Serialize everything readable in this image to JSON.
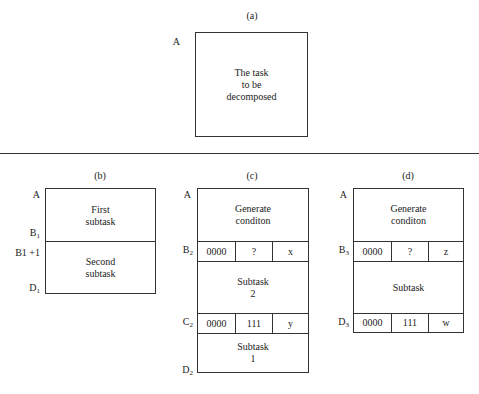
{
  "panels": {
    "a": {
      "caption": "(a)",
      "label_top": "A",
      "text_lines": [
        "The task",
        "to be",
        "decomposed"
      ]
    },
    "b": {
      "caption": "(b)",
      "labels": {
        "top": "A",
        "b1": "B",
        "b1_sub": "1",
        "b1plus": "B1 +1",
        "d1": "D",
        "d1_sub": "1"
      },
      "sections": [
        {
          "lines": [
            "First",
            "subtask"
          ]
        },
        {
          "lines": [
            "Second",
            "subtask"
          ]
        }
      ]
    },
    "c": {
      "caption": "(c)",
      "labels": {
        "top": "A",
        "b2": "B",
        "b2_sub": "2",
        "c2": "C",
        "c2_sub": "2",
        "d2": "D",
        "d2_sub": "2"
      },
      "header": {
        "lines": [
          "Generate",
          "conditon"
        ]
      },
      "row_b": [
        "0000",
        "?",
        "x"
      ],
      "middle": {
        "lines": [
          "Subtask",
          "2"
        ]
      },
      "row_c": [
        "0000",
        "111",
        "y"
      ],
      "bottom": {
        "lines": [
          "Subtask",
          "1"
        ]
      }
    },
    "d": {
      "caption": "(d)",
      "labels": {
        "top": "A",
        "b3": "B",
        "b3_sub": "3",
        "d3": "D",
        "d3_sub": "3"
      },
      "header": {
        "lines": [
          "Generate",
          "conditon"
        ]
      },
      "row_b": [
        "0000",
        "?",
        "z"
      ],
      "middle": {
        "lines": [
          "Subtask"
        ]
      },
      "row_d": [
        "0000",
        "111",
        "w"
      ]
    }
  }
}
